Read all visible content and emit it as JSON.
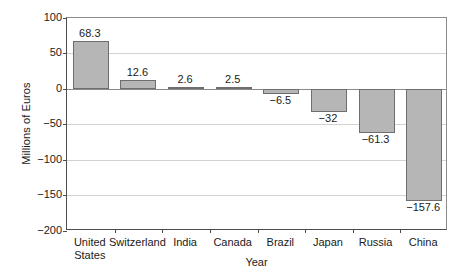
{
  "chart_data": {
    "type": "bar",
    "title": "",
    "xlabel": "Year",
    "ylabel": "Millions of Euros",
    "categories": [
      "United States",
      "Switzerland",
      "India",
      "Canada",
      "Brazil",
      "Japan",
      "Russia",
      "China"
    ],
    "category_lines": [
      [
        "United",
        "States"
      ],
      [
        "Switzerland"
      ],
      [
        "India"
      ],
      [
        "Canada"
      ],
      [
        "Brazil"
      ],
      [
        "Japan"
      ],
      [
        "Russia"
      ],
      [
        "China"
      ]
    ],
    "values": [
      68.3,
      12.6,
      2.6,
      2.5,
      -6.5,
      -32,
      -61.3,
      -157.6
    ],
    "value_labels": [
      "68.3",
      "12.6",
      "2.6",
      "2.5",
      "−6.5",
      "−32",
      "−61.3",
      "−157.6"
    ],
    "ylim": [
      -200,
      100
    ],
    "yticks": [
      100,
      50,
      0,
      -50,
      -100,
      -150,
      -200
    ],
    "ytick_labels": [
      "100",
      "50",
      "0",
      "−50",
      "−100",
      "−150",
      "−200"
    ],
    "grid": true,
    "grid_axis": "y",
    "legend": null,
    "bar_color": "#b6b6b6",
    "bar_edge_color": "#6e6e6e",
    "grid_color": "#d2d2d2",
    "axis_color": "#4d4d4d"
  }
}
